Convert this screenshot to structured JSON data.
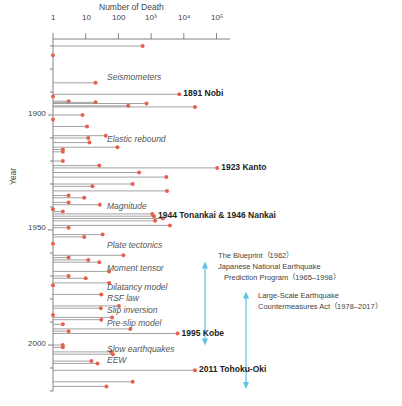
{
  "chart_data": {
    "type": "timeline-bar",
    "title": "",
    "xlabel": "Number of Death",
    "ylabel": "Year",
    "x_scale": "log",
    "x_ticks": [
      "1",
      "10",
      "100",
      "10³",
      "10⁴",
      "10⁵"
    ],
    "y_ticks": [
      "1900",
      "1950",
      "2000"
    ],
    "y_range": [
      1867,
      2020
    ],
    "grid": false,
    "events": [
      {
        "year": 1870,
        "deaths": 550
      },
      {
        "year": 1874,
        "deaths": 1
      },
      {
        "year": 1886,
        "deaths": 20
      },
      {
        "year": 1891,
        "deaths": 7270,
        "label": "1891 Nobi"
      },
      {
        "year": 1892,
        "deaths": 1
      },
      {
        "year": 1894,
        "deaths": 3
      },
      {
        "year": 1894.5,
        "deaths": 20
      },
      {
        "year": 1895,
        "deaths": 726
      },
      {
        "year": 1896,
        "deaths": 200
      },
      {
        "year": 1896.5,
        "deaths": 22000
      },
      {
        "year": 1900,
        "deaths": 8
      },
      {
        "year": 1902,
        "deaths": 1
      },
      {
        "year": 1905,
        "deaths": 11
      },
      {
        "year": 1909,
        "deaths": 41
      },
      {
        "year": 1910,
        "deaths": 12
      },
      {
        "year": 1912,
        "deaths": 13
      },
      {
        "year": 1914,
        "deaths": 94
      },
      {
        "year": 1915,
        "deaths": 2
      },
      {
        "year": 1916,
        "deaths": 2
      },
      {
        "year": 1920,
        "deaths": 2
      },
      {
        "year": 1922,
        "deaths": 26
      },
      {
        "year": 1923,
        "deaths": 105000,
        "label": "1923 Kanto"
      },
      {
        "year": 1925,
        "deaths": 428
      },
      {
        "year": 1927,
        "deaths": 2925
      },
      {
        "year": 1930,
        "deaths": 272
      },
      {
        "year": 1931,
        "deaths": 16
      },
      {
        "year": 1933,
        "deaths": 3064
      },
      {
        "year": 1935,
        "deaths": 3
      },
      {
        "year": 1936,
        "deaths": 9
      },
      {
        "year": 1938,
        "deaths": 3
      },
      {
        "year": 1939,
        "deaths": 27
      },
      {
        "year": 1941,
        "deaths": 1
      },
      {
        "year": 1942,
        "deaths": 2
      },
      {
        "year": 1943,
        "deaths": 1083
      },
      {
        "year": 1944,
        "deaths": 1223,
        "label": "1944 Tonankai & 1946 Nankai"
      },
      {
        "year": 1945,
        "deaths": 2306
      },
      {
        "year": 1946,
        "deaths": 1330
      },
      {
        "year": 1948,
        "deaths": 3769
      },
      {
        "year": 1949,
        "deaths": 3
      },
      {
        "year": 1952,
        "deaths": 33
      },
      {
        "year": 1953,
        "deaths": 9
      },
      {
        "year": 1956,
        "deaths": 1
      },
      {
        "year": 1961,
        "deaths": 142
      },
      {
        "year": 1962,
        "deaths": 3
      },
      {
        "year": 1963,
        "deaths": 12
      },
      {
        "year": 1964,
        "deaths": 26
      },
      {
        "year": 1968,
        "deaths": 52
      },
      {
        "year": 1970,
        "deaths": 3
      },
      {
        "year": 1971,
        "deaths": 10
      },
      {
        "year": 1973,
        "deaths": 52
      },
      {
        "year": 1974,
        "deaths": 1
      },
      {
        "year": 1978,
        "deaths": 30
      },
      {
        "year": 1983,
        "deaths": 104
      },
      {
        "year": 1984,
        "deaths": 29
      },
      {
        "year": 1987,
        "deaths": 1
      },
      {
        "year": 1988,
        "deaths": 64
      },
      {
        "year": 1989,
        "deaths": 30
      },
      {
        "year": 1991,
        "deaths": 2
      },
      {
        "year": 1993,
        "deaths": 231
      },
      {
        "year": 1994,
        "deaths": 3
      },
      {
        "year": 1995,
        "deaths": 6434,
        "label": "1995 Kobe"
      },
      {
        "year": 2000,
        "deaths": 2
      },
      {
        "year": 2001,
        "deaths": 2
      },
      {
        "year": 2003,
        "deaths": 60
      },
      {
        "year": 2004,
        "deaths": 68
      },
      {
        "year": 2007,
        "deaths": 15
      },
      {
        "year": 2008,
        "deaths": 23
      },
      {
        "year": 2011,
        "deaths": 22000,
        "label": "2011 Tohoku-Oki"
      },
      {
        "year": 2016,
        "deaths": 273
      },
      {
        "year": 2018,
        "deaths": 43
      }
    ],
    "method_annotations": [
      {
        "text": "Seismometers",
        "year": 1884
      },
      {
        "text": "Elastic rebound",
        "year": 1911
      },
      {
        "text": "Magnitude",
        "year": 1940
      },
      {
        "text": "Plate tectonics",
        "year": 1957
      },
      {
        "text": "Moment tensor",
        "year": 1967
      },
      {
        "text": "Dilatancy model",
        "year": 1975
      },
      {
        "text": "RSF law",
        "year": 1980
      },
      {
        "text": "Slip inversion",
        "year": 1985
      },
      {
        "text": "Pre-slip model",
        "year": 1991
      },
      {
        "text": "Slow earthquakes",
        "year": 2002
      },
      {
        "text": "EEW",
        "year": 2007
      }
    ],
    "programs": [
      {
        "lines": [
          "The Blueprint（1962）",
          "Japanese National Earthquake",
          "Prediction Program（1965–1998）"
        ],
        "start": 1965,
        "end": 1998
      },
      {
        "lines": [
          "Large-Scale Earthquake",
          "Countermeasures Act（1978–2017）"
        ],
        "start": 1978,
        "end": 2017
      }
    ]
  },
  "colors": {
    "line": "#8a8a8a",
    "dot": "#e8604a",
    "arrow": "#5bc2e7",
    "axis": "#666666"
  }
}
